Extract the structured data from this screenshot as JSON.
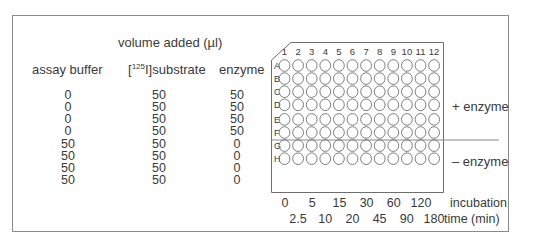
{
  "table": {
    "title": "volume added (µl)",
    "headers": {
      "assay_buffer": "assay buffer",
      "substrate_prefix": "[",
      "substrate_sup": "125",
      "substrate_suffix": "I]substrate",
      "enzyme": "enzyme"
    },
    "rows": [
      {
        "buffer": "0",
        "substrate": "50",
        "enzyme": "50"
      },
      {
        "buffer": "0",
        "substrate": "50",
        "enzyme": "50"
      },
      {
        "buffer": "0",
        "substrate": "50",
        "enzyme": "50"
      },
      {
        "buffer": "0",
        "substrate": "50",
        "enzyme": "50"
      },
      {
        "buffer": "50",
        "substrate": "50",
        "enzyme": "0"
      },
      {
        "buffer": "50",
        "substrate": "50",
        "enzyme": "0"
      },
      {
        "buffer": "50",
        "substrate": "50",
        "enzyme": "0"
      },
      {
        "buffer": "50",
        "substrate": "50",
        "enzyme": "0"
      }
    ]
  },
  "plate": {
    "columns": [
      "1",
      "2",
      "3",
      "4",
      "5",
      "6",
      "7",
      "8",
      "9",
      "10",
      "11",
      "12"
    ],
    "rows": [
      "A",
      "B",
      "C",
      "D",
      "E",
      "F",
      "G",
      "H"
    ],
    "group_labels": {
      "plus": "+ enzyme",
      "minus": "– enzyme"
    },
    "incubation_times_row1": [
      "0",
      "5",
      "15",
      "30",
      "60",
      "120"
    ],
    "incubation_times_row2": [
      "2.5",
      "10",
      "20",
      "45",
      "90",
      "180"
    ],
    "incubation_label_1": "incubation",
    "incubation_label_2": "time (min)"
  },
  "colors": {
    "line": "#6e6e6e",
    "text": "#3a3a3a",
    "frame": "#8a8a8a"
  }
}
